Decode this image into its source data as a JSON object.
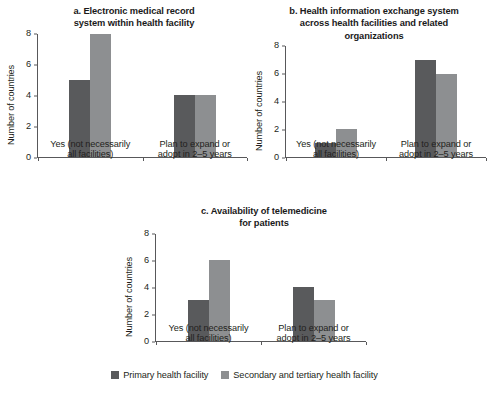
{
  "figure": {
    "background": "#ffffff",
    "colors": {
      "primary": "#595a5c",
      "secondary": "#8d8f91",
      "axis": "#58585a",
      "text": "#231f20"
    }
  },
  "legend": {
    "position": "bottom-center",
    "items": [
      {
        "label": "Primary health facility",
        "color": "#595a5c",
        "swatch": "square-swatch"
      },
      {
        "label": "Secondary and tertiary health facility",
        "color": "#8d8f91",
        "swatch": "square-swatch"
      }
    ]
  },
  "chart_data": [
    {
      "type": "bar",
      "id": "a",
      "title": "a. Electronic medical record system within health facility",
      "title_lines": [
        "a. Electronic medical record",
        "system within health facility"
      ],
      "xlabel": "",
      "ylabel": "Number of countries",
      "ylim": [
        0,
        8
      ],
      "yticks": [
        0,
        2,
        4,
        6,
        8
      ],
      "ytick_labels": [
        "0",
        "2",
        "4",
        "6",
        "8"
      ],
      "grid": false,
      "categories": [
        "Yes (not necessarily all facilities)",
        "Plan to expand or adopt in 2–5 years"
      ],
      "category_lines": [
        [
          "Yes (not necessarily",
          "all facilities)"
        ],
        [
          "Plan to expand or",
          "adopt in 2–5 years"
        ]
      ],
      "series": [
        {
          "name": "Primary health facility",
          "color": "#595a5c",
          "values": [
            5,
            4
          ]
        },
        {
          "name": "Secondary and tertiary health facility",
          "color": "#8d8f91",
          "values": [
            8,
            4
          ]
        }
      ]
    },
    {
      "type": "bar",
      "id": "b",
      "title": "b. Health information exchange system across health facilities and related organizations",
      "title_lines": [
        "b. Health information exchange system",
        "across health facilities and related",
        "organizations"
      ],
      "xlabel": "",
      "ylabel": "Number of countries",
      "ylim": [
        0,
        8
      ],
      "yticks": [
        0,
        2,
        4,
        6,
        8
      ],
      "ytick_labels": [
        "0",
        "2",
        "4",
        "6",
        "8"
      ],
      "grid": false,
      "categories": [
        "Yes (not necessarily all facilities)",
        "Plan to expand or adopt in 2–5 years"
      ],
      "category_lines": [
        [
          "Yes (not necessarily",
          "all facilities)"
        ],
        [
          "Plan to expand or",
          "adopt in 2–5 years"
        ]
      ],
      "series": [
        {
          "name": "Primary health facility",
          "color": "#595a5c",
          "values": [
            1,
            7
          ]
        },
        {
          "name": "Secondary and tertiary health facility",
          "color": "#8d8f91",
          "values": [
            2,
            6
          ]
        }
      ]
    },
    {
      "type": "bar",
      "id": "c",
      "title": "c. Availability of telemedicine for patients",
      "title_lines": [
        "c. Availability of telemedicine",
        "for patients"
      ],
      "xlabel": "",
      "ylabel": "Number of countries",
      "ylim": [
        0,
        8
      ],
      "yticks": [
        0,
        2,
        4,
        6,
        8
      ],
      "ytick_labels": [
        "0",
        "2",
        "4",
        "6",
        "8"
      ],
      "grid": false,
      "categories": [
        "Yes (not necessarily all facilities)",
        "Plan to expand or adopt in 2–5 years"
      ],
      "category_lines": [
        [
          "Yes (not necessarily",
          "all facilities)"
        ],
        [
          "Plan to expand or",
          "adopt in 2–5 years"
        ]
      ],
      "series": [
        {
          "name": "Primary health facility",
          "color": "#595a5c",
          "values": [
            3,
            4
          ]
        },
        {
          "name": "Secondary and tertiary health facility",
          "color": "#8d8f91",
          "values": [
            6,
            3
          ]
        }
      ]
    }
  ]
}
